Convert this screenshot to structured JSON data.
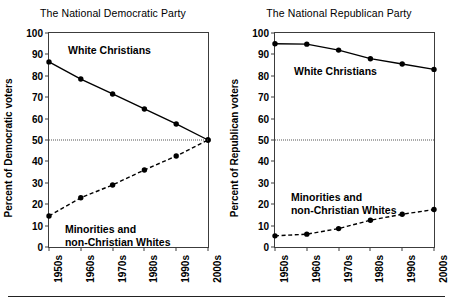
{
  "figure": {
    "footer_rule": true
  },
  "chart_data": [
    {
      "type": "line",
      "panel": "left",
      "title": "The National Democratic Party",
      "xlabel": "",
      "ylabel": "Percent of Democratic voters",
      "categories": [
        "1950s",
        "1960s",
        "1970s",
        "1980s",
        "1990s",
        "2000s"
      ],
      "ylim": [
        0,
        100
      ],
      "yticks": [
        0,
        10,
        20,
        30,
        40,
        50,
        60,
        70,
        80,
        90,
        100
      ],
      "grid": false,
      "legend": "inline-annotation",
      "reference_line": 50,
      "series": [
        {
          "name": "White Christians",
          "style": "solid",
          "marker": "filled-circle",
          "label_x_pct": 12,
          "label_y_value": 95,
          "values": [
            86.5,
            78.5,
            71.5,
            64.5,
            57.5,
            50
          ]
        },
        {
          "name": "Minorities and non-Christian Whites",
          "style": "dashed",
          "marker": "filled-circle",
          "label_line1": "Minorities and",
          "label_line2": "non-Christian Whites",
          "label_x_pct": 10,
          "label_y_value": 11,
          "values": [
            14.5,
            23,
            29,
            36,
            42.5,
            50
          ]
        }
      ]
    },
    {
      "type": "line",
      "panel": "right",
      "title": "The National Republican Party",
      "xlabel": "",
      "ylabel": "Percent of Republican voters",
      "categories": [
        "1950s",
        "1960s",
        "1970s",
        "1980s",
        "1990s",
        "2000s"
      ],
      "ylim": [
        0,
        100
      ],
      "yticks": [
        0,
        10,
        20,
        30,
        40,
        50,
        60,
        70,
        80,
        90,
        100
      ],
      "grid": false,
      "legend": "inline-annotation",
      "reference_line": 50,
      "series": [
        {
          "name": "White Christians",
          "style": "solid",
          "marker": "filled-circle",
          "label_x_pct": 12,
          "label_y_value": 85,
          "values": [
            95,
            94.8,
            92,
            88,
            85.5,
            83
          ]
        },
        {
          "name": "Minorities and non-Christian Whites",
          "style": "dashed",
          "marker": "filled-circle",
          "label_line1": "Minorities and",
          "label_line2": "non-Christian Whites",
          "label_x_pct": 10,
          "label_y_value": 26,
          "values": [
            5.2,
            6,
            8.6,
            12.5,
            15.3,
            17.5
          ]
        }
      ]
    }
  ]
}
